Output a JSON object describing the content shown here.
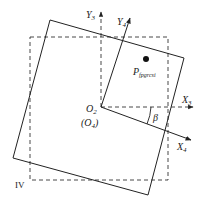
{
  "diagram": {
    "labels": {
      "y3": "Y",
      "y3_sub": "3",
      "y4": "Y",
      "y4_sub": "4",
      "x3": "X",
      "x3_sub": "3",
      "x4": "X",
      "x4_sub": "4",
      "o2": "O",
      "o2_sub": "2",
      "o4_open": "(O",
      "o4_sub": "4",
      "o4_close": ")",
      "beta": "β",
      "point": "P",
      "point_sub": "fpgrcsi",
      "quadrant": "IV"
    },
    "colors": {
      "line": "#222222",
      "background": "#ffffff"
    }
  }
}
